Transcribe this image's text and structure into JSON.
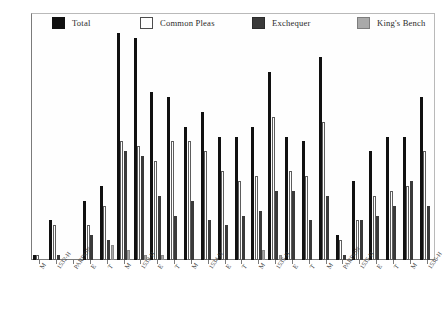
{
  "chart_data": {
    "type": "bar",
    "title": "",
    "subtitle": "",
    "xlabel": "",
    "ylabel": "",
    "ylim": [
      0,
      50
    ],
    "ytick_step": 5,
    "yticks": [
      0,
      5,
      10,
      15,
      20,
      25,
      30,
      35,
      40,
      45,
      50
    ],
    "grid": false,
    "legend_position": "top",
    "legend": [
      "Total",
      "Common Pleas",
      "Exchequer",
      "King's Bench"
    ],
    "categories": [
      "M",
      "1532-H",
      "PARDON",
      "E",
      "T",
      "M",
      "1533-H",
      "E",
      "T",
      "M",
      "1534-H",
      "E",
      "T",
      "M",
      "1535-H",
      "E",
      "T",
      "M",
      "PARDON",
      "1535-H",
      "E",
      "T",
      "M",
      "1536-H"
    ],
    "series": [
      {
        "name": "Total",
        "color": "#111111",
        "values": [
          1,
          8,
          0,
          12,
          15,
          46,
          45,
          34,
          33,
          27,
          30,
          25,
          25,
          27,
          38,
          25,
          24,
          41,
          5,
          16,
          22,
          25,
          25,
          33
        ]
      },
      {
        "name": "Common Pleas",
        "color": "#ffffff",
        "values": [
          1,
          7,
          0,
          7,
          11,
          24,
          23,
          20,
          24,
          24,
          22,
          18,
          16,
          17,
          29,
          18,
          17,
          28,
          4,
          8,
          13,
          14,
          15,
          22
        ]
      },
      {
        "name": "Exchequer",
        "color": "#3a3a3a",
        "values": [
          0,
          1,
          0,
          5,
          4,
          22,
          21,
          13,
          9,
          12,
          8,
          7,
          9,
          10,
          14,
          14,
          8,
          13,
          1,
          8,
          9,
          11,
          16,
          11
        ]
      },
      {
        "name": "King's Bench",
        "color": "#a9a9a9",
        "values": [
          0,
          0,
          0,
          0,
          3,
          2,
          1,
          1,
          0,
          0,
          0,
          0,
          0,
          2,
          1,
          0,
          0,
          0,
          0,
          0,
          0,
          0,
          0,
          0
        ]
      }
    ]
  },
  "legend": {
    "items": [
      {
        "label": "Total",
        "swatch": "total"
      },
      {
        "label": "Common Pleas",
        "swatch": "cp"
      },
      {
        "label": "Exchequer",
        "swatch": "exch"
      },
      {
        "label": "King's Bench",
        "swatch": "kb"
      }
    ]
  }
}
